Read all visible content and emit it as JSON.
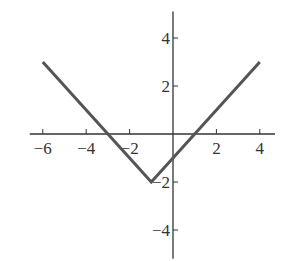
{
  "chart_data": {
    "type": "line",
    "title": "",
    "xlabel": "",
    "ylabel": "",
    "function": "y = |x + 1| - 2",
    "series": [
      {
        "name": "piecewise linear",
        "x": [
          -6,
          -1,
          4
        ],
        "y": [
          3,
          -2,
          3
        ],
        "color": "#555555"
      }
    ],
    "x_ticks": [
      -6,
      -4,
      -2,
      2,
      4
    ],
    "y_ticks": [
      4,
      2,
      -2,
      -4
    ],
    "x_tick_labels": [
      "−6",
      "−4",
      "−2",
      "2",
      "4"
    ],
    "y_tick_labels": [
      "4",
      "2",
      "−2",
      "−4"
    ],
    "xlim": [
      -6.6,
      4.7
    ],
    "ylim": [
      -5.2,
      5.1
    ],
    "grid": false,
    "legend": null
  },
  "colors": {
    "axis": "#333333",
    "line": "#555555",
    "background": "#ffffff"
  }
}
